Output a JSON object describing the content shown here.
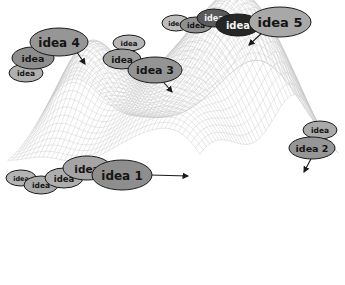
{
  "figure": {
    "kind": "idea-landscape-diagram",
    "background_color": "#ffffff",
    "outline_color": "#1a1a1a",
    "mesh_color": "#c9c9c9",
    "mesh_shadow_color": "#d8d8d8"
  },
  "palette": {
    "lightest": "#c2c2c2",
    "light": "#b4b4b4",
    "mid_light": "#a8a8a8",
    "mid": "#9a9a9a",
    "mid_dark": "#8a8a8a",
    "dark": "#6e6e6e",
    "darker": "#4a4a4a",
    "darkest": "#262626"
  },
  "surface": {
    "type": "wireframe-mesh",
    "peaks": [
      {
        "name": "peak-left",
        "cx": 88,
        "base_y": 163,
        "apex_y": 60,
        "half_width": 34,
        "pointed_by": "idea 4"
      },
      {
        "name": "peak-center",
        "cx": 176,
        "base_y": 205,
        "apex_y": 88,
        "half_width": 62,
        "pointed_by": "idea 3"
      },
      {
        "name": "peak-right",
        "cx": 246,
        "base_y": 180,
        "apex_y": 48,
        "half_width": 44,
        "pointed_by": "idea 5"
      },
      {
        "name": "peak-front",
        "cx": 196,
        "base_y": 262,
        "apex_y": 168,
        "half_width": 55,
        "pointed_by": "idea 1"
      },
      {
        "name": "peak-right-small",
        "cx": 296,
        "base_y": 205,
        "apex_y": 158,
        "half_width": 34,
        "pointed_by": "idea 2"
      }
    ]
  },
  "clusters": [
    {
      "id": "idea-1",
      "label": "idea 1",
      "target_peak": "peak-front",
      "arrow": {
        "from_x": 150,
        "from_y": 175,
        "to_x": 188,
        "to_y": 176
      },
      "bubbles": [
        {
          "text": "idea",
          "cx": 21,
          "cy": 178,
          "rx": 15,
          "ry": 8,
          "fill": "#b4b4b4",
          "font_size": 6.5
        },
        {
          "text": "idea",
          "cx": 41,
          "cy": 185,
          "rx": 17,
          "ry": 9,
          "fill": "#a8a8a8",
          "font_size": 7.5
        },
        {
          "text": "idea",
          "cx": 64,
          "cy": 178,
          "rx": 19,
          "ry": 10,
          "fill": "#aeaeae",
          "font_size": 8.5
        },
        {
          "text": "idea",
          "cx": 87,
          "cy": 168,
          "rx": 24,
          "ry": 12,
          "fill": "#a5a5a5",
          "font_size": 10.5
        },
        {
          "text": "idea 1",
          "cx": 122,
          "cy": 175,
          "rx": 30,
          "ry": 15,
          "fill": "#8e8e8e",
          "font_size": 12
        }
      ]
    },
    {
      "id": "idea-2",
      "label": "idea 2",
      "target_peak": "peak-right-small",
      "arrow": {
        "from_x": 312,
        "from_y": 157,
        "to_x": 304,
        "to_y": 172
      },
      "bubbles": [
        {
          "text": "idea",
          "cx": 320,
          "cy": 130,
          "rx": 17,
          "ry": 9,
          "fill": "#aaaaaa",
          "font_size": 7.5
        },
        {
          "text": "idea 2",
          "cx": 312,
          "cy": 148,
          "rx": 23,
          "ry": 11,
          "fill": "#969696",
          "font_size": 9.5
        }
      ]
    },
    {
      "id": "idea-3",
      "label": "idea 3",
      "target_peak": "peak-center",
      "arrow": {
        "from_x": 160,
        "from_y": 78,
        "to_x": 172,
        "to_y": 92
      },
      "bubbles": [
        {
          "text": "idea",
          "cx": 129,
          "cy": 43,
          "rx": 16,
          "ry": 8,
          "fill": "#b6b6b6",
          "font_size": 7
        },
        {
          "text": "idea",
          "cx": 122,
          "cy": 59,
          "rx": 19,
          "ry": 10,
          "fill": "#9d9d9d",
          "font_size": 9
        },
        {
          "text": "idea 3",
          "cx": 155,
          "cy": 70,
          "rx": 27,
          "ry": 13,
          "fill": "#949494",
          "font_size": 11
        }
      ]
    },
    {
      "id": "idea-4",
      "label": "idea 4",
      "target_peak": "peak-left",
      "arrow": {
        "from_x": 72,
        "from_y": 45,
        "to_x": 85,
        "to_y": 64
      },
      "bubbles": [
        {
          "text": "idea",
          "cx": 26,
          "cy": 73,
          "rx": 17,
          "ry": 9,
          "fill": "#b0b0b0",
          "font_size": 7.5
        },
        {
          "text": "idea",
          "cx": 33,
          "cy": 58,
          "rx": 21,
          "ry": 11,
          "fill": "#8d8d8d",
          "font_size": 9.5
        },
        {
          "text": "idea 4",
          "cx": 59,
          "cy": 42,
          "rx": 29,
          "ry": 14,
          "fill": "#969696",
          "font_size": 12
        }
      ]
    },
    {
      "id": "idea-5",
      "label": "idea 5",
      "target_peak": "peak-right",
      "arrow": {
        "from_x": 265,
        "from_y": 30,
        "to_x": 249,
        "to_y": 45
      },
      "bubbles": [
        {
          "text": "idea",
          "cx": 176,
          "cy": 23,
          "rx": 14,
          "ry": 8,
          "fill": "#bdbdbd",
          "font_size": 6.5
        },
        {
          "text": "idea",
          "cx": 196,
          "cy": 25,
          "rx": 16,
          "ry": 8,
          "fill": "#8f8f8f",
          "font_size": 7.5
        },
        {
          "text": "idea",
          "cx": 214,
          "cy": 18,
          "rx": 17,
          "ry": 9,
          "fill": "#5a5a5a",
          "font_size": 8
        },
        {
          "text": "idea",
          "cx": 238,
          "cy": 25,
          "rx": 22,
          "ry": 11,
          "fill": "#262626",
          "font_size": 10
        },
        {
          "text": "idea 5",
          "cx": 280,
          "cy": 22,
          "rx": 31,
          "ry": 15,
          "fill": "#a8a8a8",
          "font_size": 13
        }
      ]
    }
  ]
}
